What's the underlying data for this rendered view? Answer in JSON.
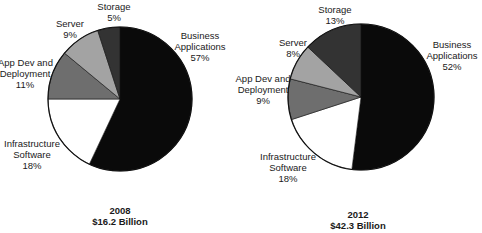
{
  "chart_data": [
    {
      "type": "pie",
      "title": "2008",
      "subtitle": "$16.2 Billion",
      "categories": [
        "Business Applications",
        "Infrastructure Software",
        "App Dev and Deployment",
        "Server",
        "Storage"
      ],
      "values": [
        57,
        18,
        11,
        9,
        5
      ],
      "unit": "%",
      "colors": [
        "#0a0a0a",
        "#ffffff",
        "#6e6e6e",
        "#a3a3a3",
        "#333333"
      ]
    },
    {
      "type": "pie",
      "title": "2012",
      "subtitle": "$42.3 Billion",
      "categories": [
        "Business Applications",
        "Infrastructure Software",
        "App Dev and Deployment",
        "Server",
        "Storage"
      ],
      "values": [
        52,
        18,
        9,
        8,
        13
      ],
      "unit": "%",
      "colors": [
        "#0a0a0a",
        "#ffffff",
        "#6e6e6e",
        "#a3a3a3",
        "#333333"
      ]
    }
  ],
  "pies": [
    {
      "caption": {
        "year": "2008",
        "total": "$16.2 Billion"
      },
      "labels": {
        "business": {
          "l1": "Business",
          "l2": "Applications",
          "pct": "57%"
        },
        "infra": {
          "l1": "Infrastructure",
          "l2": "Software",
          "pct": "18%"
        },
        "appdev": {
          "l1": "App Dev and",
          "l2": "Deployment",
          "pct": "11%"
        },
        "server": {
          "l1": "Server",
          "pct": "9%"
        },
        "storage": {
          "l1": "Storage",
          "pct": "5%"
        }
      }
    },
    {
      "caption": {
        "year": "2012",
        "total": "$42.3 Billion"
      },
      "labels": {
        "business": {
          "l1": "Business",
          "l2": "Applications",
          "pct": "52%"
        },
        "infra": {
          "l1": "Infrastructure",
          "l2": "Software",
          "pct": "18%"
        },
        "appdev": {
          "l1": "App Dev and",
          "l2": "Deployment",
          "pct": "9%"
        },
        "server": {
          "l1": "Server",
          "pct": "8%"
        },
        "storage": {
          "l1": "Storage",
          "pct": "13%"
        }
      }
    }
  ]
}
